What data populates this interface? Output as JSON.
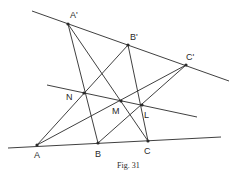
{
  "figure": {
    "caption": "Fig. 31",
    "points": [
      {
        "id": "A_prime",
        "label": "A'"
      },
      {
        "id": "B_prime",
        "label": "B'"
      },
      {
        "id": "C_prime",
        "label": "C'"
      },
      {
        "id": "N",
        "label": "N"
      },
      {
        "id": "M",
        "label": "M"
      },
      {
        "id": "L",
        "label": "L"
      },
      {
        "id": "A",
        "label": "A"
      },
      {
        "id": "B",
        "label": "B"
      },
      {
        "id": "C",
        "label": "C"
      }
    ],
    "lines": [
      {
        "name": "line-a-prime-b-prime-c-prime",
        "through": [
          "A'",
          "B'",
          "C'"
        ]
      },
      {
        "name": "line-a-b-c",
        "through": [
          "A",
          "B",
          "C"
        ]
      },
      {
        "name": "line-n-m-l",
        "through": [
          "N",
          "M",
          "L"
        ]
      },
      {
        "name": "segment-a-prime-b",
        "through": [
          "A'",
          "B"
        ]
      },
      {
        "name": "segment-a-prime-c",
        "through": [
          "A'",
          "C"
        ]
      },
      {
        "name": "segment-b-prime-a",
        "through": [
          "B'",
          "A"
        ]
      },
      {
        "name": "segment-b-prime-c",
        "through": [
          "B'",
          "C"
        ]
      },
      {
        "name": "segment-c-prime-a",
        "through": [
          "C'",
          "A"
        ]
      },
      {
        "name": "segment-c-prime-b",
        "through": [
          "C'",
          "B"
        ]
      }
    ]
  }
}
